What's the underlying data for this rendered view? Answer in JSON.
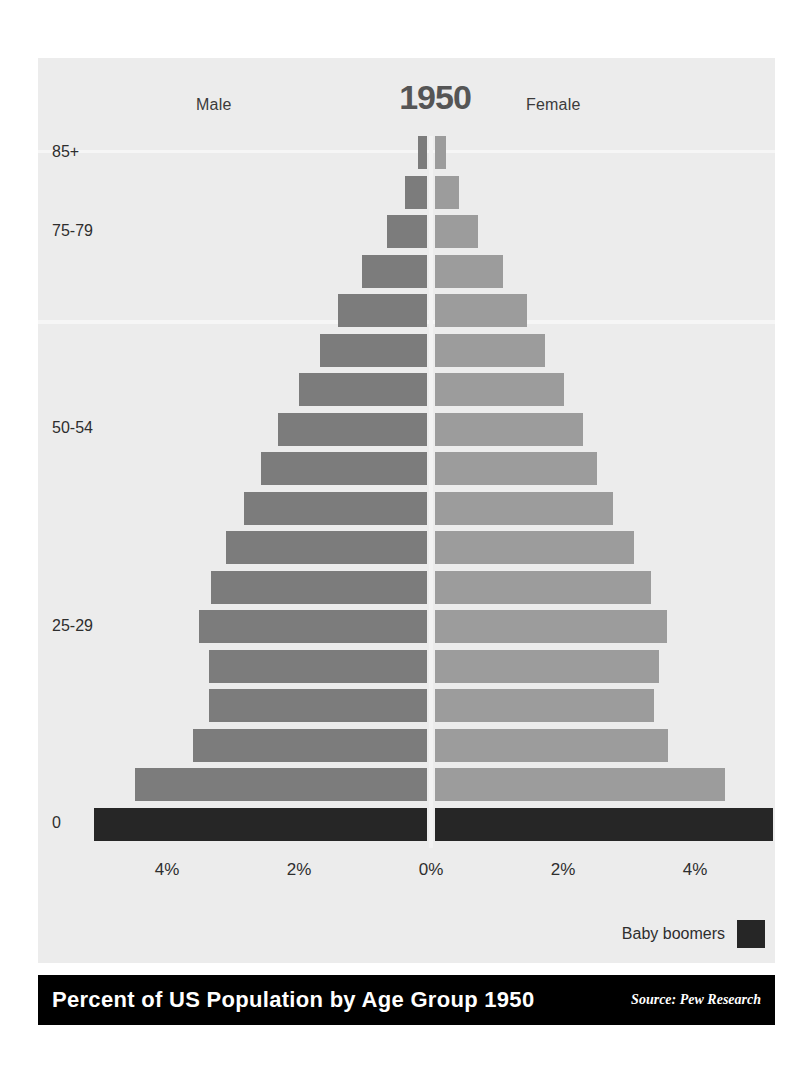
{
  "header": {
    "male_label": "Male",
    "female_label": "Female",
    "year": "1950"
  },
  "legend": {
    "label": "Baby boomers",
    "swatch_color": "#262626"
  },
  "footer": {
    "title": "Percent of US Population by Age Group 1950",
    "source": "Source: Pew Research"
  },
  "colors": {
    "male": "#7c7c7c",
    "female": "#9c9c9c",
    "boomer": "#262626",
    "panel_background": "#ececec",
    "footer_background": "#000000",
    "axis_line": "#f2f2f2"
  },
  "axis": {
    "y_visible_labels": [
      "85+",
      "75-79",
      "50-54",
      "25-29",
      "0"
    ],
    "x_tick_labels": [
      "4%",
      "2%",
      "0%",
      "2%",
      "4%"
    ],
    "x_tick_values": [
      -4,
      -2,
      0,
      2,
      4
    ],
    "x_max_percent": 5.6
  },
  "chart_data": {
    "type": "bar",
    "subtype": "population-pyramid",
    "title": "Percent of US Population by Age Group 1950",
    "year": "1950",
    "xlabel": "",
    "ylabel": "",
    "xlim": [
      -5.6,
      5.6
    ],
    "grid": false,
    "legend_position": "bottom-right",
    "unit": "percent of total US population",
    "categories": [
      "85+",
      "80-84",
      "75-79",
      "70-74",
      "65-69",
      "60-64",
      "55-59",
      "50-54",
      "45-49",
      "40-44",
      "35-39",
      "30-34",
      "25-29",
      "20-24",
      "15-19",
      "10-14",
      "5-9",
      "0"
    ],
    "series": [
      {
        "name": "Male",
        "color": "#7c7c7c",
        "values": [
          0.13,
          0.34,
          0.61,
          0.98,
          1.35,
          1.62,
          1.94,
          2.26,
          2.52,
          2.77,
          3.05,
          3.28,
          3.46,
          3.3,
          3.31,
          3.55,
          4.42,
          5.04
        ]
      },
      {
        "name": "Female",
        "color": "#9c9c9c",
        "values": [
          0.16,
          0.37,
          0.65,
          1.03,
          1.4,
          1.66,
          1.95,
          2.24,
          2.46,
          2.7,
          3.02,
          3.27,
          3.52,
          3.4,
          3.32,
          3.53,
          4.4,
          5.12
        ]
      }
    ],
    "highlight": {
      "name": "Baby boomers",
      "categories": [
        "0"
      ],
      "color": "#262626"
    },
    "annotations": [
      "Male",
      "Female",
      "1950",
      "Baby boomers"
    ]
  }
}
